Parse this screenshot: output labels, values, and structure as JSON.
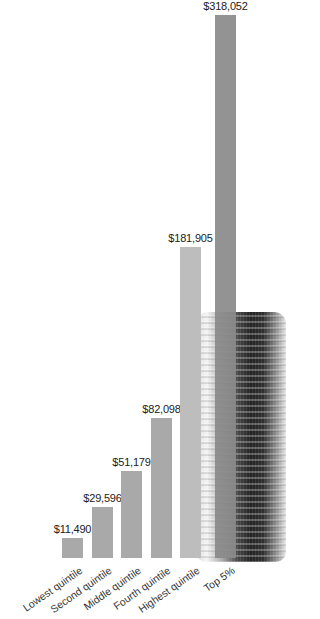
{
  "chart_data": {
    "type": "bar",
    "title": "",
    "xlabel": "",
    "ylabel": "",
    "categories": [
      "Lowest quintile",
      "Second quintile",
      "Middle quintile",
      "Fourth quintile",
      "Highest quintile",
      "Top 5%"
    ],
    "values": [
      11490,
      29596,
      51179,
      82098,
      181905,
      318052
    ],
    "value_labels": [
      "$11,490",
      "$29,596",
      "$51,179",
      "$82,098",
      "$181,905",
      "$318,052"
    ],
    "ylim": [
      0,
      318052
    ],
    "grid": false,
    "legend": "none",
    "colors": [
      "#a9a9a9",
      "#a9a9a9",
      "#a9a9a9",
      "#a9a9a9",
      "#bdbdbd",
      "#8a8a8a"
    ],
    "background_image": "stack-of-coins"
  }
}
